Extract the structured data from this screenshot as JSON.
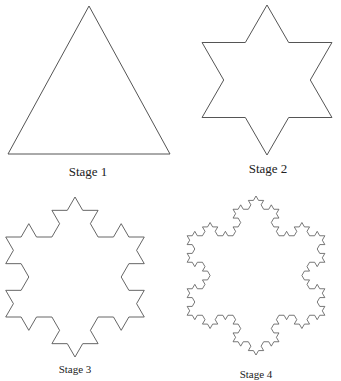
{
  "stroke_color": "#555555",
  "figures": [
    {
      "label": "Stage 1",
      "iterations": 0,
      "cx": 89,
      "cy": 104,
      "r": 98,
      "points": [
        [
          89,
          6
        ],
        [
          8,
          154
        ],
        [
          170,
          154
        ]
      ],
      "label_x": 88,
      "label_y": 164,
      "label_size": "normal"
    },
    {
      "label": "Stage 2",
      "iterations": 1,
      "cx": 267,
      "cy": 80,
      "r": 75,
      "label_x": 268,
      "label_y": 161,
      "label_size": "normal"
    },
    {
      "label": "Stage 3",
      "iterations": 2,
      "cx": 75,
      "cy": 277,
      "r": 80,
      "label_x": 75,
      "label_y": 363,
      "label_size": "small"
    },
    {
      "label": "Stage 4",
      "iterations": 3,
      "cx": 256,
      "cy": 275.5,
      "r": 79.5,
      "label_x": 256,
      "label_y": 368,
      "label_size": "small"
    }
  ]
}
